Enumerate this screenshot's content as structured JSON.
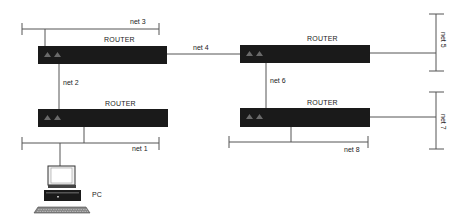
{
  "diagram": {
    "type": "network-topology",
    "colors": {
      "line": "#555555",
      "router_body": "#1a1a1a",
      "router_indicator": "#6a6a6a",
      "background": "#ffffff"
    },
    "routers": [
      {
        "id": "router-1",
        "label": "ROUTER"
      },
      {
        "id": "router-2",
        "label": "ROUTER"
      },
      {
        "id": "router-3",
        "label": "ROUTER"
      },
      {
        "id": "router-4",
        "label": "ROUTER"
      }
    ],
    "networks": [
      {
        "id": "net-1",
        "label": "net 1"
      },
      {
        "id": "net-2",
        "label": "net 2"
      },
      {
        "id": "net-3",
        "label": "net 3"
      },
      {
        "id": "net-4",
        "label": "net 4"
      },
      {
        "id": "net-5",
        "label": "net 5"
      },
      {
        "id": "net-6",
        "label": "net 6"
      },
      {
        "id": "net-7",
        "label": "net 7"
      },
      {
        "id": "net-8",
        "label": "net 8"
      }
    ],
    "hosts": [
      {
        "id": "pc",
        "label": "PC"
      }
    ],
    "links": [
      {
        "from": "router-1",
        "to": "net-3"
      },
      {
        "from": "router-1",
        "to": "router-2",
        "via": "net-4"
      },
      {
        "from": "router-1",
        "to": "router-3",
        "via": "net-2"
      },
      {
        "from": "router-2",
        "to": "net-5"
      },
      {
        "from": "router-2",
        "to": "router-4",
        "via": "net-6"
      },
      {
        "from": "router-3",
        "to": "net-1"
      },
      {
        "from": "router-4",
        "to": "net-7"
      },
      {
        "from": "router-4",
        "to": "net-8"
      },
      {
        "from": "pc",
        "to": "net-1"
      }
    ]
  }
}
